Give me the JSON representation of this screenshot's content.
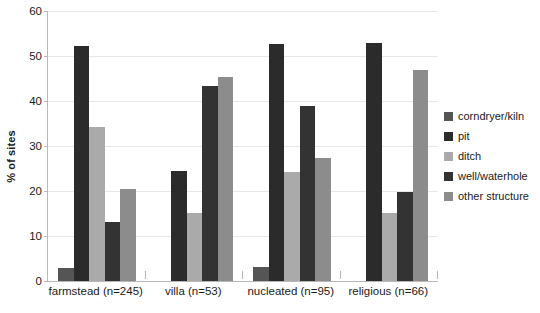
{
  "chart_data": {
    "type": "bar",
    "title": "",
    "xlabel": "",
    "ylabel": "% of sites",
    "ylim": [
      0,
      60
    ],
    "yticks": [
      0,
      10,
      20,
      30,
      40,
      50,
      60
    ],
    "ytick_labels": [
      "0",
      "10",
      "20",
      "30",
      "40",
      "50",
      "60"
    ],
    "grid": true,
    "legend_position": "right",
    "categories": [
      "farmstead (n=245)",
      "villa (n=53)",
      "nucleated (n=95)",
      "religious (n=66)"
    ],
    "series": [
      {
        "name": "corndryer/kiln",
        "color": "#555555",
        "values": [
          3.0,
          0.0,
          3.1,
          0.0
        ]
      },
      {
        "name": "pit",
        "color": "#2b2b2b",
        "values": [
          52.2,
          24.5,
          52.6,
          53.0
        ]
      },
      {
        "name": "ditch",
        "color": "#aaaaaa",
        "values": [
          34.3,
          15.1,
          24.2,
          15.2
        ]
      },
      {
        "name": "well/waterhole",
        "color": "#333333",
        "values": [
          13.1,
          43.4,
          38.9,
          19.7
        ]
      },
      {
        "name": "other structure",
        "color": "#8c8c8c",
        "values": [
          20.4,
          45.3,
          27.4,
          46.9
        ]
      }
    ]
  },
  "axis": {
    "grid_color": "#e8e8e8",
    "axis_color": "#b8b8b8",
    "text_color": "#1a1a1a"
  },
  "legend": {
    "items": [
      {
        "label": "corndryer/kiln",
        "color": "#555555"
      },
      {
        "label": "pit",
        "color": "#2b2b2b"
      },
      {
        "label": "ditch",
        "color": "#aaaaaa"
      },
      {
        "label": "well/waterhole",
        "color": "#333333"
      },
      {
        "label": "other structure",
        "color": "#8c8c8c"
      }
    ]
  }
}
